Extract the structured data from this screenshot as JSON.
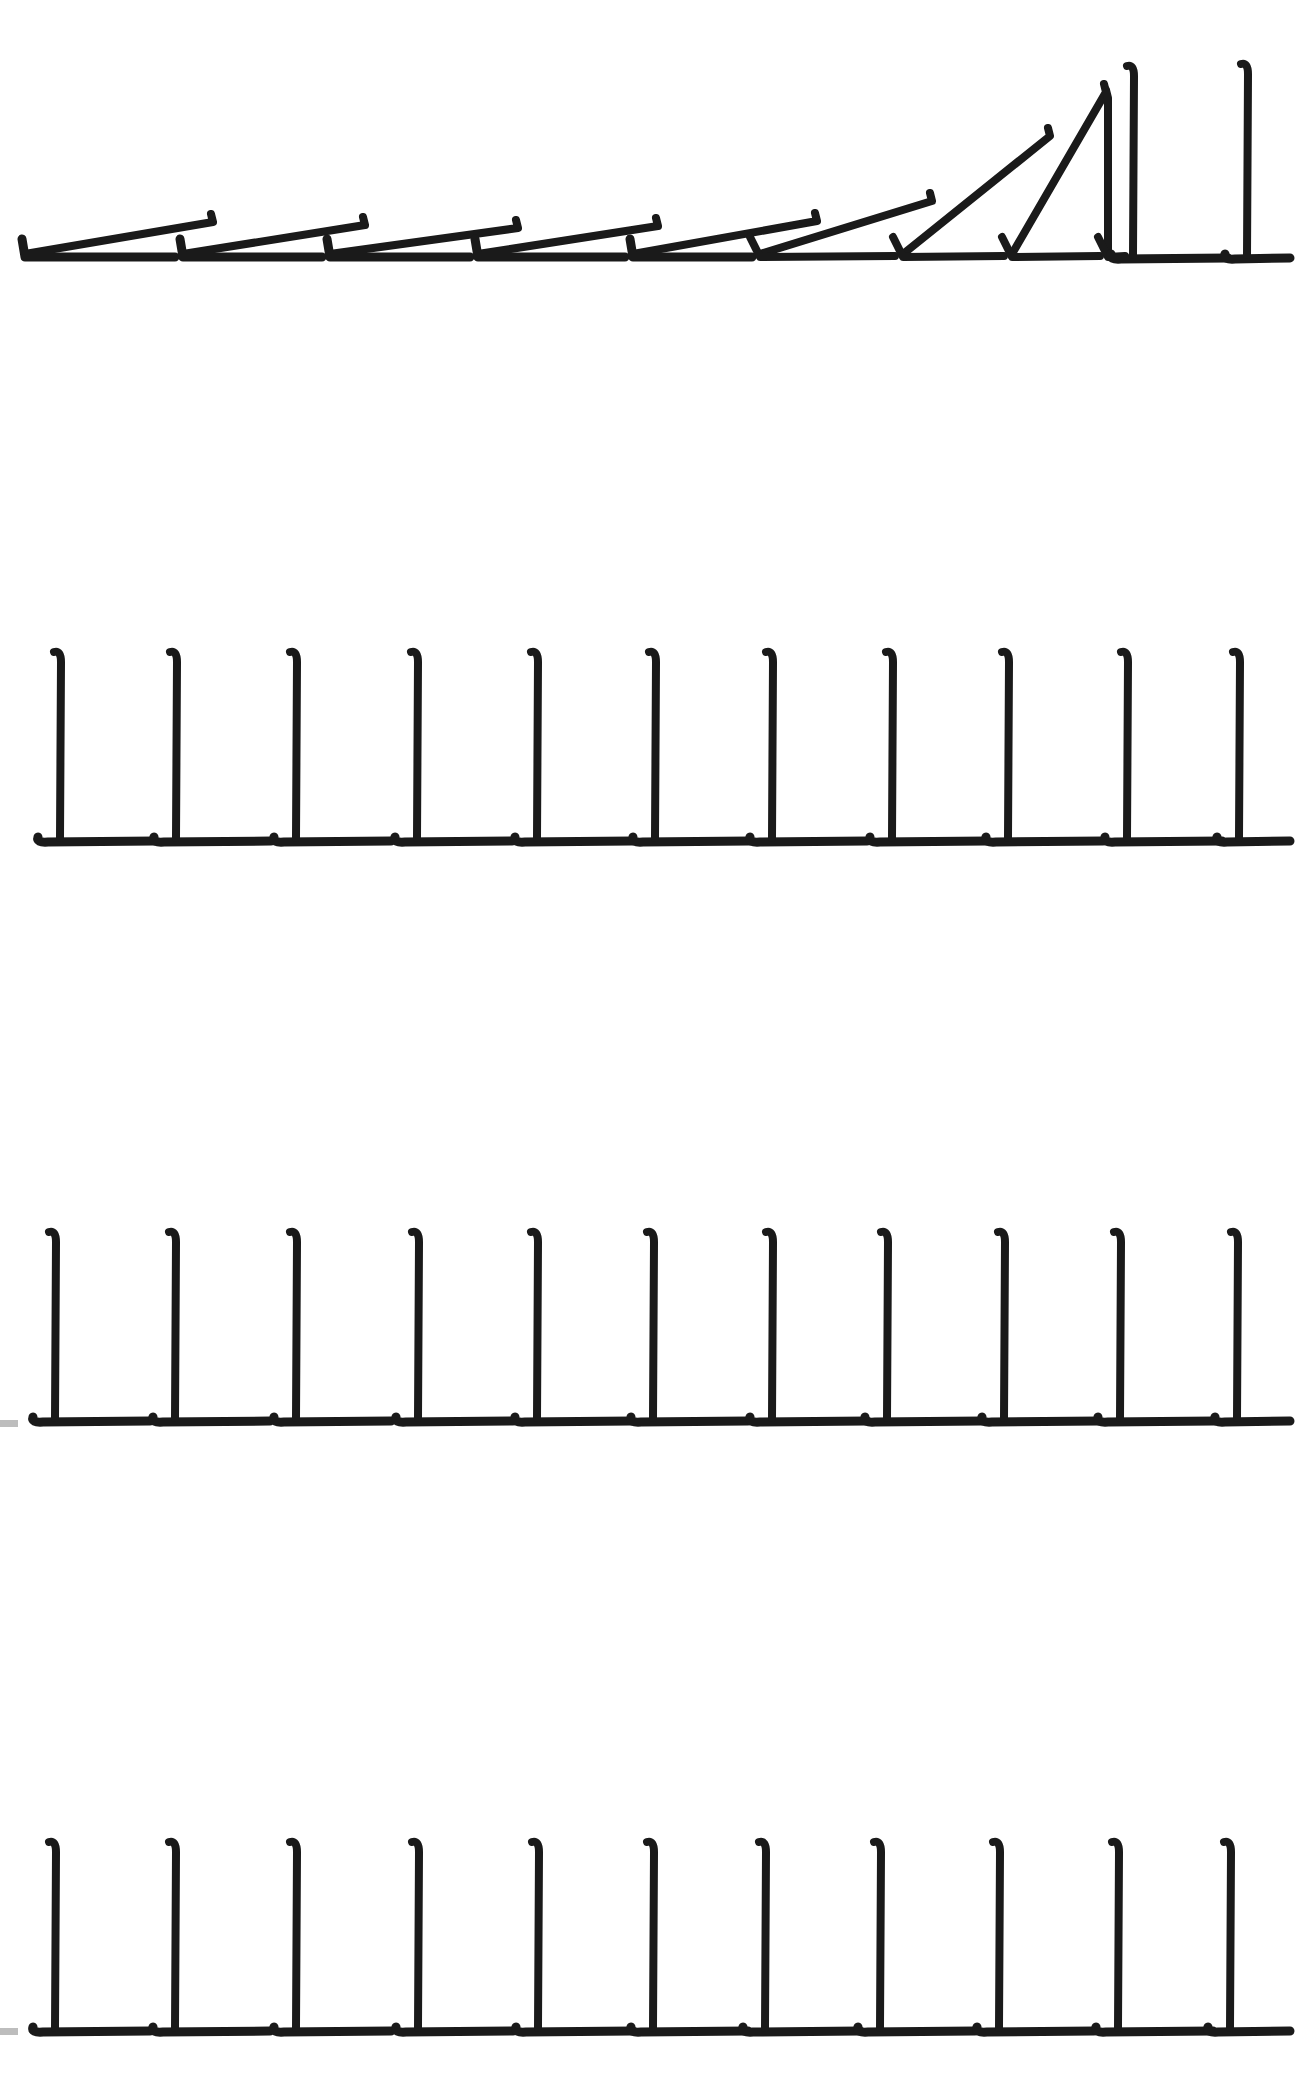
{
  "illustration": {
    "subject": "dominoes",
    "ink_color": "#1a1a1a",
    "background": "#ffffff",
    "rows": [
      {
        "name": "row-1-falling",
        "state": "chain-reaction",
        "baseline_y": 257,
        "dominoes": [
          {
            "x": 25,
            "tilt": "fallen",
            "top_x": 213,
            "top_y": 214
          },
          {
            "x": 183,
            "tilt": "fallen",
            "top_x": 365,
            "top_y": 217
          },
          {
            "x": 330,
            "tilt": "fallen",
            "top_x": 518,
            "top_y": 220
          },
          {
            "x": 478,
            "tilt": "fallen",
            "top_x": 658,
            "top_y": 218
          },
          {
            "x": 633,
            "tilt": "fallen",
            "top_x": 817,
            "top_y": 213
          },
          {
            "x": 760,
            "tilt": "leaning",
            "top_x": 932,
            "top_y": 193
          },
          {
            "x": 903,
            "tilt": "leaning",
            "top_x": 1050,
            "top_y": 128
          },
          {
            "x": 1012,
            "tilt": "leaning",
            "top_x": 1106,
            "top_y": 84
          },
          {
            "x": 1108,
            "tilt": "leaning",
            "top_x": 1108,
            "top_y": 90
          },
          {
            "x": 1133,
            "tilt": "upright",
            "top_x": 1133,
            "top_y": 64
          },
          {
            "x": 1247,
            "tilt": "upright",
            "top_x": 1247,
            "top_y": 62
          }
        ]
      },
      {
        "name": "row-2-standing",
        "state": "upright",
        "baseline_y": 840,
        "dominoes": [
          {
            "x": 60
          },
          {
            "x": 176
          },
          {
            "x": 296
          },
          {
            "x": 417
          },
          {
            "x": 537
          },
          {
            "x": 655
          },
          {
            "x": 772
          },
          {
            "x": 892
          },
          {
            "x": 1008
          },
          {
            "x": 1127
          },
          {
            "x": 1239
          }
        ]
      },
      {
        "name": "row-3-standing",
        "state": "upright",
        "baseline_y": 1420,
        "dominoes": [
          {
            "x": 55
          },
          {
            "x": 175
          },
          {
            "x": 296
          },
          {
            "x": 418
          },
          {
            "x": 537
          },
          {
            "x": 653
          },
          {
            "x": 772
          },
          {
            "x": 887
          },
          {
            "x": 1004
          },
          {
            "x": 1120
          },
          {
            "x": 1237
          }
        ]
      },
      {
        "name": "row-4-standing",
        "state": "upright",
        "baseline_y": 2030,
        "dominoes": [
          {
            "x": 55
          },
          {
            "x": 175
          },
          {
            "x": 296
          },
          {
            "x": 418
          },
          {
            "x": 538
          },
          {
            "x": 653
          },
          {
            "x": 765
          },
          {
            "x": 880
          },
          {
            "x": 999
          },
          {
            "x": 1118
          },
          {
            "x": 1230
          }
        ]
      }
    ]
  }
}
